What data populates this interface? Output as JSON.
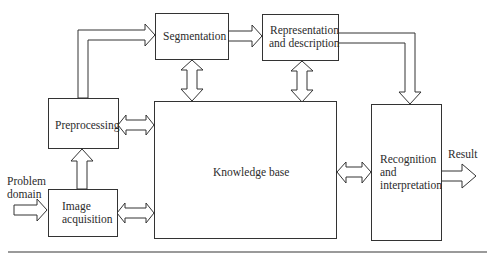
{
  "diagram": {
    "type": "block-diagram",
    "nodes": [
      {
        "id": "segmentation",
        "label": "Segmentation"
      },
      {
        "id": "representation",
        "label_lines": [
          "Representation",
          "and description"
        ]
      },
      {
        "id": "preprocessing",
        "label": "Preprocessing"
      },
      {
        "id": "knowledge_base",
        "label": "Knowledge base"
      },
      {
        "id": "image_acquisition",
        "label_lines": [
          "Image",
          "acquisition"
        ]
      },
      {
        "id": "recognition",
        "label_lines": [
          "Recognition",
          "and",
          "interpretation"
        ]
      }
    ],
    "inputs": {
      "problem_domain_lines": [
        "Problem",
        "domain"
      ]
    },
    "outputs": {
      "result": "Result"
    },
    "edges": [
      {
        "from": "problem_domain",
        "to": "image_acquisition",
        "kind": "one-way"
      },
      {
        "from": "image_acquisition",
        "to": "preprocessing",
        "kind": "one-way"
      },
      {
        "from": "preprocessing",
        "to": "segmentation",
        "kind": "one-way"
      },
      {
        "from": "segmentation",
        "to": "representation",
        "kind": "one-way"
      },
      {
        "from": "representation",
        "to": "recognition",
        "kind": "one-way"
      },
      {
        "from": "recognition",
        "to": "result",
        "kind": "one-way"
      },
      {
        "from": "knowledge_base",
        "to": "preprocessing",
        "kind": "two-way"
      },
      {
        "from": "knowledge_base",
        "to": "image_acquisition",
        "kind": "two-way"
      },
      {
        "from": "knowledge_base",
        "to": "segmentation",
        "kind": "two-way"
      },
      {
        "from": "knowledge_base",
        "to": "representation",
        "kind": "two-way"
      },
      {
        "from": "knowledge_base",
        "to": "recognition",
        "kind": "two-way"
      }
    ]
  }
}
